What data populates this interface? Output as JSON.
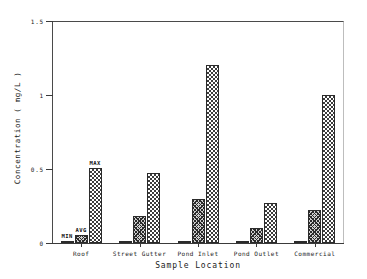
{
  "chart_data": {
    "type": "bar",
    "title": "",
    "xlabel": "Sample Location",
    "ylabel": "Concentration ( mg/L )",
    "categories": [
      "Roof",
      "Street Gutter",
      "Pond Inlet",
      "Pond Outlet",
      "Commercial"
    ],
    "series": [
      {
        "name": "MIN",
        "values": [
          0.005,
          0.012,
          0.005,
          0.005,
          0.005
        ]
      },
      {
        "name": "AVG",
        "values": [
          0.055,
          0.18,
          0.3,
          0.1,
          0.22
        ]
      },
      {
        "name": "MAX",
        "values": [
          0.51,
          0.47,
          1.2,
          0.27,
          1.0
        ]
      }
    ],
    "ylim": [
      0,
      1.5
    ],
    "yticks": [
      0,
      0.5,
      1,
      1.5
    ],
    "ytick_labels": [
      "0",
      "0.5",
      "1",
      "1.5"
    ],
    "grid": false,
    "legend": "none",
    "annotations": [
      {
        "text": "MIN",
        "series": "MIN",
        "category": "Roof"
      },
      {
        "text": "AVG",
        "series": "AVG",
        "category": "Roof"
      },
      {
        "text": "MAX",
        "series": "MAX",
        "category": "Roof"
      }
    ]
  }
}
